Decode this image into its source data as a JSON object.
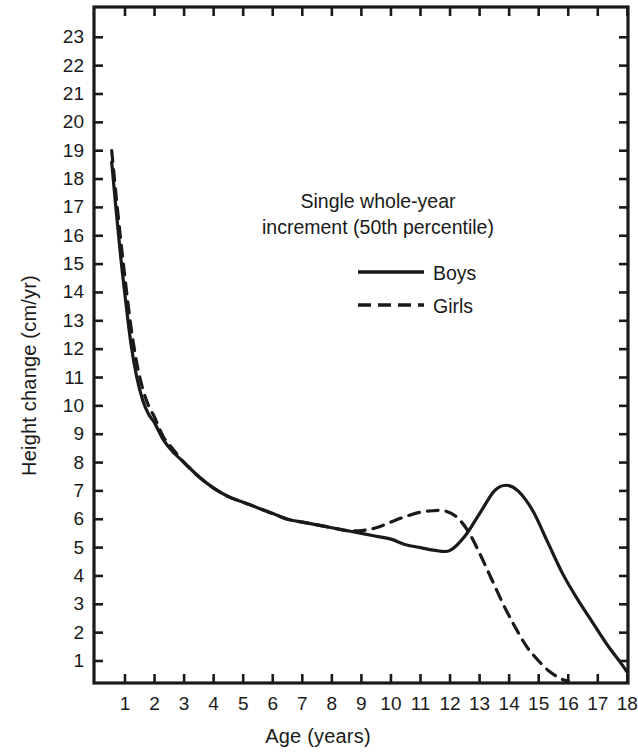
{
  "chart_data": {
    "type": "line",
    "title": "",
    "subtitle": "",
    "xlabel": "Age (years)",
    "ylabel": "Height change (cm/yr)",
    "xlim": [
      0.2,
      18.6
    ],
    "ylim": [
      0,
      23.6
    ],
    "xticks": [
      1,
      2,
      3,
      4,
      5,
      6,
      7,
      8,
      9,
      10,
      11,
      12,
      13,
      14,
      15,
      16,
      17,
      18
    ],
    "xtick_labels": [
      "1",
      "2",
      "3",
      "4",
      "5",
      "6",
      "7",
      "8",
      "9",
      "10",
      "11",
      "12",
      "13",
      "14",
      "15",
      "16",
      "17",
      "18"
    ],
    "yticks": [
      1,
      2,
      3,
      4,
      5,
      6,
      7,
      8,
      9,
      10,
      11,
      12,
      13,
      14,
      15,
      16,
      17,
      18,
      19,
      20,
      21,
      22,
      23
    ],
    "ytick_labels": [
      "1",
      "2",
      "3",
      "4",
      "5",
      "6",
      "7",
      "8",
      "9",
      "10",
      "11",
      "12",
      "13",
      "14",
      "15",
      "16",
      "17",
      "18",
      "19",
      "20",
      "21",
      "22",
      "23"
    ],
    "grid": false,
    "frame": "box",
    "ticks_on": [
      "left",
      "bottom",
      "top",
      "right"
    ],
    "legend_position": "upper-right-inside",
    "annotation": "Single whole-year increment (50th percentile)",
    "annotation_lines": [
      "Single whole-year",
      "increment (50th percentile)"
    ],
    "line_color": "#1a1a1a",
    "series": [
      {
        "name": "Boys",
        "style": "solid",
        "x": [
          0.55,
          0.7,
          0.85,
          1.0,
          1.2,
          1.4,
          1.6,
          1.8,
          2.0,
          2.3,
          2.6,
          3.0,
          3.5,
          4.0,
          4.5,
          5.0,
          5.5,
          6.0,
          6.5,
          7.0,
          7.5,
          8.0,
          8.5,
          9.0,
          9.5,
          10.0,
          10.5,
          11.0,
          11.5,
          12.0,
          12.5,
          13.0,
          13.5,
          13.9,
          14.3,
          14.8,
          15.3,
          15.8,
          16.3,
          16.8,
          17.3,
          17.8,
          18.0
        ],
        "values": [
          18.6,
          16.9,
          15.3,
          13.9,
          12.2,
          11.0,
          10.2,
          9.7,
          9.4,
          8.8,
          8.4,
          8.0,
          7.5,
          7.1,
          6.8,
          6.6,
          6.4,
          6.2,
          6.0,
          5.9,
          5.8,
          5.7,
          5.6,
          5.5,
          5.4,
          5.3,
          5.1,
          5.0,
          4.9,
          4.9,
          5.4,
          6.2,
          7.0,
          7.2,
          7.0,
          6.3,
          5.2,
          4.1,
          3.2,
          2.4,
          1.6,
          0.9,
          0.6
        ]
      },
      {
        "name": "Girls",
        "style": "dashed",
        "x": [
          0.55,
          0.7,
          0.85,
          1.0,
          1.2,
          1.4,
          1.6,
          1.8,
          2.0,
          2.3,
          2.6,
          3.0,
          3.5,
          4.0,
          4.5,
          5.0,
          5.5,
          6.0,
          6.5,
          7.0,
          7.5,
          8.0,
          8.5,
          9.0,
          9.5,
          10.0,
          10.5,
          11.0,
          11.4,
          11.8,
          12.2,
          12.6,
          13.0,
          13.4,
          13.8,
          14.2,
          14.6,
          15.0,
          15.4,
          15.8,
          16.0
        ],
        "values": [
          19.0,
          17.4,
          15.9,
          14.5,
          12.8,
          11.5,
          10.6,
          10.0,
          9.6,
          8.9,
          8.5,
          8.0,
          7.5,
          7.1,
          6.8,
          6.6,
          6.4,
          6.2,
          6.0,
          5.9,
          5.8,
          5.7,
          5.6,
          5.6,
          5.7,
          5.9,
          6.1,
          6.25,
          6.3,
          6.3,
          6.1,
          5.6,
          4.8,
          3.9,
          3.0,
          2.2,
          1.5,
          1.0,
          0.6,
          0.35,
          0.3
        ]
      }
    ]
  },
  "legend": {
    "caption_line1": "Single whole-year",
    "caption_line2": "increment (50th percentile)",
    "boys_label": "Boys",
    "girls_label": "Girls"
  },
  "axes": {
    "x_title": "Age (years)",
    "y_title": "Height change (cm/yr)"
  }
}
